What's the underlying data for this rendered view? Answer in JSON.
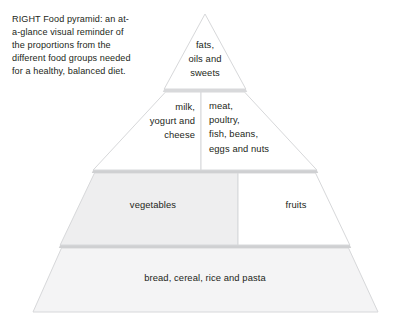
{
  "caption": {
    "text": "RIGHT Food pyramid: an at-a-glance visual reminder of the proportions from the different food groups needed for a healthy, balanced diet."
  },
  "diagram": {
    "title": "Food pyramid",
    "type": "pyramid",
    "colors": {
      "text": "#231f20",
      "outline": "#d7d8da",
      "gap_band": "#cfd0d2",
      "fill_white": "#ffffff",
      "fill_light_grey": "#eeeeef",
      "fill_lighter_grey": "#f4f4f5"
    },
    "tiers": [
      {
        "level": 1,
        "position": "apex",
        "cells": [
          {
            "id": "sweets",
            "label": "fats,\noils and\nsweets",
            "align": "center",
            "fill": "#ffffff"
          }
        ]
      },
      {
        "level": 2,
        "position": "upper-middle",
        "cells": [
          {
            "id": "dairy",
            "label": "milk,\nyogurt and\ncheese",
            "align": "right",
            "fill": "#ffffff"
          },
          {
            "id": "protein",
            "label": "meat,\npoultry,\nfish, beans,\neggs and nuts",
            "align": "left",
            "fill": "#ffffff"
          }
        ]
      },
      {
        "level": 3,
        "position": "lower-middle",
        "cells": [
          {
            "id": "vegetables",
            "label": "vegetables",
            "align": "center",
            "fill": "#eeeeef"
          },
          {
            "id": "fruits",
            "label": "fruits",
            "align": "center",
            "fill": "#ffffff"
          }
        ]
      },
      {
        "level": 4,
        "position": "base",
        "cells": [
          {
            "id": "grains",
            "label": "bread, cereal, rice and pasta",
            "align": "center",
            "fill": "#f4f4f5"
          }
        ]
      }
    ]
  }
}
